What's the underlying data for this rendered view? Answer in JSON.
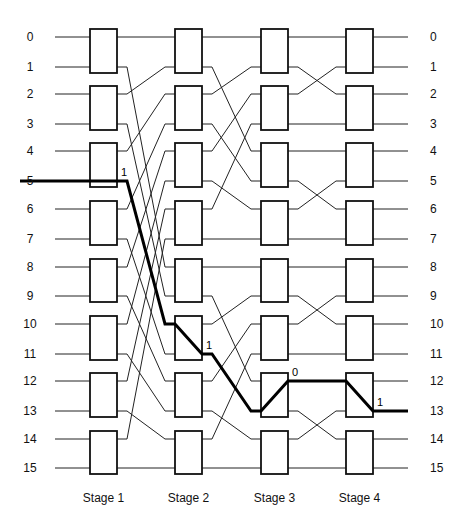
{
  "title": "",
  "inputs": [
    "0",
    "1",
    "2",
    "3",
    "4",
    "5",
    "6",
    "7",
    "8",
    "9",
    "10",
    "11",
    "12",
    "13",
    "14",
    "15"
  ],
  "outputs": [
    "0",
    "1",
    "2",
    "3",
    "4",
    "5",
    "6",
    "7",
    "8",
    "9",
    "10",
    "11",
    "12",
    "13",
    "14",
    "15"
  ],
  "stages": [
    {
      "label": "Stage 1"
    },
    {
      "label": "Stage 2"
    },
    {
      "label": "Stage 3"
    },
    {
      "label": "Stage 4"
    }
  ],
  "connections": {
    "stage1_to_stage2": [
      0,
      8,
      1,
      9,
      2,
      10,
      3,
      11,
      4,
      12,
      5,
      13,
      6,
      14,
      7,
      15
    ],
    "stage2_to_stage3": [
      0,
      4,
      1,
      5,
      2,
      6,
      3,
      7,
      8,
      12,
      9,
      13,
      10,
      14,
      11,
      15
    ],
    "stage3_to_stage4": [
      0,
      2,
      1,
      3,
      4,
      6,
      5,
      7,
      8,
      10,
      9,
      11,
      12,
      14,
      13,
      15
    ]
  },
  "highlighted_route": {
    "source": 5,
    "destination": 13,
    "hops": [
      {
        "stage": 1,
        "in": 5,
        "out": 5,
        "bit": "1"
      },
      {
        "stage": 2,
        "in": 10,
        "out": 11,
        "bit": "1"
      },
      {
        "stage": 3,
        "in": 13,
        "out": 12,
        "bit": "0"
      },
      {
        "stage": 4,
        "in": 12,
        "out": 13,
        "bit": "1"
      }
    ]
  },
  "colors": {
    "line": "#222222",
    "box": "#111111",
    "route": "#000000",
    "background": "#ffffff"
  }
}
